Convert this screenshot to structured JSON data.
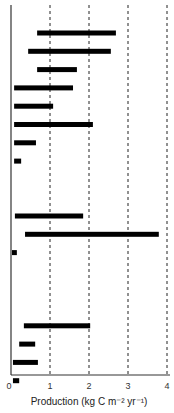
{
  "chart_data": {
    "type": "bar",
    "orientation": "horizontal-range",
    "title": "",
    "xlabel": "Production (kg C m⁻² yr⁻¹)",
    "ylabel": "",
    "xlim": [
      0,
      4
    ],
    "xticks": [
      "0",
      "1",
      "2",
      "3",
      "4"
    ],
    "grid": "vertical dashed at 1, 2, 3, 4",
    "legend": "none",
    "ranges": [
      {
        "min": 0.67,
        "max": 2.69
      },
      {
        "min": 0.44,
        "max": 2.56
      },
      {
        "min": 0.67,
        "max": 1.69
      },
      {
        "min": 0.08,
        "max": 1.59
      },
      {
        "min": 0.08,
        "max": 1.08
      },
      {
        "min": 0.08,
        "max": 2.1
      },
      {
        "min": 0.08,
        "max": 0.64
      },
      {
        "min": 0.08,
        "max": 0.26
      },
      {
        "min": 0.1,
        "max": 1.85
      },
      {
        "min": 0.36,
        "max": 3.79
      },
      {
        "min": 0.0,
        "max": 0.15
      },
      {
        "min": 0.33,
        "max": 2.03
      },
      {
        "min": 0.21,
        "max": 0.62
      },
      {
        "min": 0.05,
        "max": 0.69
      },
      {
        "min": 0.05,
        "max": 0.21
      }
    ],
    "row_slots": [
      0,
      1,
      2,
      3,
      4,
      5,
      6,
      7,
      10,
      11,
      12,
      16,
      17,
      18,
      19
    ]
  }
}
